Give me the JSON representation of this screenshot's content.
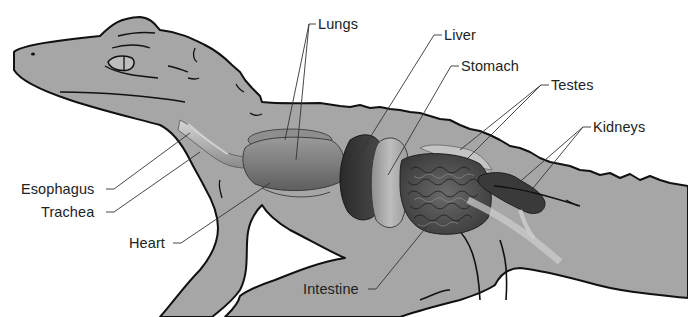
{
  "diagram": {
    "colors": {
      "background": "#ffffff",
      "skin": "#a6a6a6",
      "outline": "#111111",
      "leader_line": "#333333",
      "label_text": "#222222"
    },
    "labels": [
      {
        "id": "lungs",
        "text": "Lungs",
        "x": 318,
        "y": 16,
        "side": "left-leader"
      },
      {
        "id": "liver",
        "text": "Liver",
        "x": 444,
        "y": 27,
        "side": "left-leader"
      },
      {
        "id": "stomach",
        "text": "Stomach",
        "x": 461,
        "y": 57,
        "side": "left-leader"
      },
      {
        "id": "testes",
        "text": "Testes",
        "x": 551,
        "y": 76,
        "side": "left-leader"
      },
      {
        "id": "kidneys",
        "text": "Kidneys",
        "x": 593,
        "y": 118,
        "side": "left-leader"
      },
      {
        "id": "esophagus",
        "text": "Esophagus",
        "x": 21,
        "y": 179,
        "side": "right-leader"
      },
      {
        "id": "trachea",
        "text": "Trachea",
        "x": 41,
        "y": 202,
        "side": "right-leader"
      },
      {
        "id": "heart",
        "text": "Heart",
        "x": 129,
        "y": 233,
        "side": "right-leader"
      },
      {
        "id": "intestine",
        "text": "Intestine",
        "x": 303,
        "y": 279,
        "side": "right-leader"
      }
    ]
  }
}
